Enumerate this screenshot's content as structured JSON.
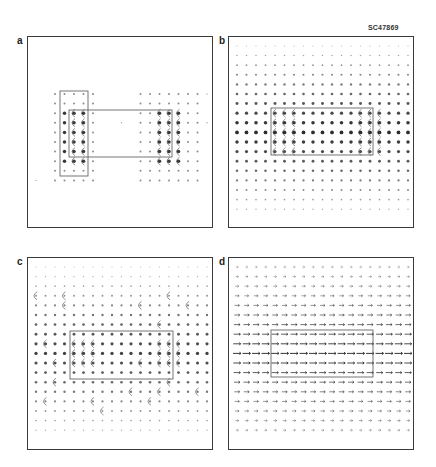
{
  "figure": {
    "id_label": "SC47869",
    "panels": [
      {
        "label": "a",
        "frame": {
          "x": 27,
          "y": 36,
          "w": 186,
          "h": 192
        },
        "field_type": "sparse-vortex",
        "rects": [
          {
            "x": 32,
            "y": 54,
            "w": 28,
            "h": 85
          },
          {
            "x": 41,
            "y": 73,
            "w": 103,
            "h": 47
          }
        ]
      },
      {
        "label": "b",
        "frame": {
          "x": 228,
          "y": 36,
          "w": 186,
          "h": 192
        },
        "field_type": "dots-intensity",
        "rects": [
          {
            "x": 42,
            "y": 71,
            "w": 102,
            "h": 47
          }
        ]
      },
      {
        "label": "c",
        "frame": {
          "x": 27,
          "y": 257,
          "w": 186,
          "h": 193
        },
        "field_type": "noisy-curls",
        "rects": [
          {
            "x": 42,
            "y": 73,
            "w": 103,
            "h": 48
          }
        ]
      },
      {
        "label": "d",
        "frame": {
          "x": 228,
          "y": 257,
          "w": 186,
          "h": 193
        },
        "field_type": "arrows-right",
        "rects": [
          {
            "x": 42,
            "y": 72,
            "w": 102,
            "h": 47
          }
        ]
      }
    ],
    "grid": {
      "cols": 19,
      "rows": 18,
      "x0": 8,
      "y0": 9,
      "dx": 9.5,
      "dy": 9.6
    },
    "colors": {
      "ink": "#2a2a2a",
      "frame": "#3a3a3a",
      "rect": "#666666",
      "bg": "#ffffff"
    }
  }
}
